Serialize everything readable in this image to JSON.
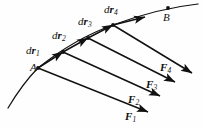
{
  "figure": {
    "kind": "physics-vector-diagram",
    "background_color": "#fefefe",
    "stroke_color": "#111111",
    "width": 203,
    "height": 128,
    "point_labels": [
      {
        "name": "point-a",
        "text": "A",
        "x": 30,
        "y": 62
      },
      {
        "name": "point-b",
        "text": "B",
        "x": 163,
        "y": 12
      }
    ],
    "displacement_labels": [
      {
        "name": "dr1",
        "prefix": "d",
        "vector": "r",
        "subscript": "1",
        "x": 26,
        "y": 45
      },
      {
        "name": "dr2",
        "prefix": "d",
        "vector": "r",
        "subscript": "2",
        "x": 52,
        "y": 30
      },
      {
        "name": "dr3",
        "prefix": "d",
        "vector": "r",
        "subscript": "3",
        "x": 78,
        "y": 16
      },
      {
        "name": "dr4",
        "prefix": "d",
        "vector": "r",
        "subscript": "4",
        "x": 104,
        "y": 4
      }
    ],
    "force_labels": [
      {
        "name": "f1",
        "vector": "F",
        "subscript": "1",
        "x": 125,
        "y": 111
      },
      {
        "name": "f2",
        "vector": "F",
        "subscript": "2",
        "x": 128,
        "y": 94
      },
      {
        "name": "f3",
        "vector": "F",
        "subscript": "3",
        "x": 146,
        "y": 79
      },
      {
        "name": "f4",
        "vector": "F",
        "subscript": "4",
        "x": 160,
        "y": 62
      }
    ],
    "path": {
      "name": "trajectory-curve",
      "description": "curved trajectory through A and B",
      "d": "M 8 108 C 20 88 30 76 38 68 C 58 52 82 36 113 25 C 140 15 170 7 198 4"
    },
    "dots": [
      {
        "name": "vertex-a",
        "x": 38,
        "y": 68
      },
      {
        "name": "vertex-1",
        "x": 63,
        "y": 52
      },
      {
        "name": "vertex-2",
        "x": 88,
        "y": 38
      },
      {
        "name": "vertex-3",
        "x": 113,
        "y": 25
      },
      {
        "name": "vertex-b",
        "x": 168,
        "y": 8
      }
    ],
    "displacement_vectors": [
      {
        "name": "dr1-arrow",
        "x1": 38,
        "y1": 68,
        "x2": 63,
        "y2": 52
      },
      {
        "name": "dr2-arrow",
        "x1": 63,
        "y1": 52,
        "x2": 88,
        "y2": 38
      },
      {
        "name": "dr3-arrow",
        "x1": 88,
        "y1": 38,
        "x2": 113,
        "y2": 25
      },
      {
        "name": "dr4-arrow",
        "x1": 113,
        "y1": 25,
        "x2": 145,
        "y2": 17
      }
    ],
    "force_vectors": [
      {
        "name": "f1-arrow",
        "x1": 38,
        "y1": 68,
        "x2": 148,
        "y2": 112
      },
      {
        "name": "f2-arrow",
        "x1": 63,
        "y1": 52,
        "x2": 160,
        "y2": 96
      },
      {
        "name": "f3-arrow",
        "x1": 88,
        "y1": 38,
        "x2": 175,
        "y2": 82
      },
      {
        "name": "f4-arrow",
        "x1": 113,
        "y1": 25,
        "x2": 192,
        "y2": 73
      }
    ]
  }
}
